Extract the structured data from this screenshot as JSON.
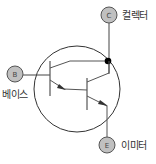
{
  "diagram": {
    "type": "darlington-transistor-symbol",
    "terminals": {
      "collector": {
        "letter": "C",
        "label": "컬렉터"
      },
      "base": {
        "letter": "B",
        "label": "베이스"
      },
      "emitter": {
        "letter": "E",
        "label": "이미터"
      }
    },
    "colors": {
      "line": "#333333",
      "terminal_fill": "#c0c0c0",
      "terminal_stroke": "#555555",
      "junction_dot": "#000000"
    }
  }
}
